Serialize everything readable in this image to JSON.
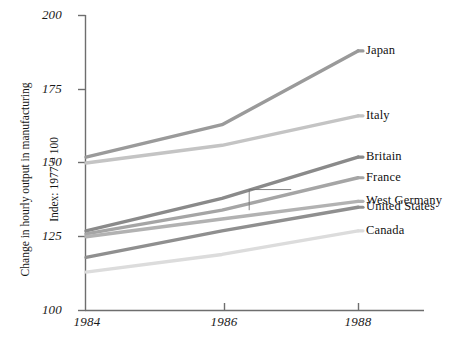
{
  "chart_data": {
    "type": "line",
    "title": "",
    "subtitle": "",
    "xlabel": "",
    "ylabel": "Change in hourly output in manufacturing\nIndex: 1977 = 100",
    "ylabel_line1": "Change in hourly output in manufacturing",
    "ylabel_line2": "Index: 1977 = 100",
    "x": [
      1984,
      1986,
      1988
    ],
    "categories": [
      "1984",
      "1986",
      "1988"
    ],
    "xticklabels": [
      "1984",
      "1986",
      "1988"
    ],
    "yticklabels": [
      "100",
      "125",
      "150",
      "175",
      "200"
    ],
    "yticks": [
      100,
      125,
      150,
      175,
      200
    ],
    "xlim": [
      1984,
      1988
    ],
    "ylim": [
      100,
      200
    ],
    "grid": false,
    "legend_position": "right-inline-end-of-line",
    "annotation_bracket": {
      "description": "thin vertical connector from United States line up to West Germany leader line",
      "x": 1986.4,
      "y_from": 134,
      "y_to": 141
    },
    "series": [
      {
        "name": "Japan",
        "label": "Japan",
        "color": "#9a9a9a",
        "values": [
          152,
          163,
          188
        ],
        "label_y": 188
      },
      {
        "name": "Italy",
        "label": "Italy",
        "color": "#c4c4c4",
        "values": [
          150,
          156,
          166
        ],
        "label_y": 166
      },
      {
        "name": "Britain",
        "label": "Britain",
        "color": "#8a8a8a",
        "values": [
          127,
          138,
          152
        ],
        "label_y": 152
      },
      {
        "name": "France",
        "label": "France",
        "color": "#a5a5a5",
        "values": [
          126,
          134,
          145
        ],
        "label_y": 145
      },
      {
        "name": "West Germany",
        "label": "West Germany",
        "color": "#b2b2b2",
        "values": [
          125,
          131,
          137
        ],
        "label_y": 137
      },
      {
        "name": "United States",
        "label": "United States",
        "color": "#8f8f8f",
        "values": [
          118,
          127,
          135
        ],
        "label_y": 135
      },
      {
        "name": "Canada",
        "label": "Canada",
        "color": "#dcdcdc",
        "values": [
          113,
          119,
          127
        ],
        "label_y": 127
      }
    ],
    "axis_color": "#6e6e6e"
  }
}
